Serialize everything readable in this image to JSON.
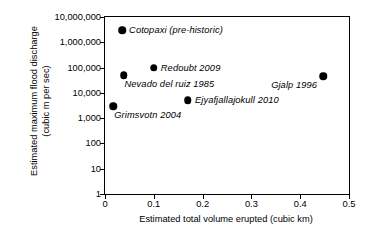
{
  "chart_data": {
    "type": "scatter",
    "title": "",
    "xlabel": "Estimated total volume erupted (cubic km)",
    "ylabel_line1": "Estimated maximum flood discharge",
    "ylabel_line2": "(cubic m per sec)",
    "xlim": [
      0,
      0.5
    ],
    "ylim": [
      1,
      10000000
    ],
    "yscale": "log",
    "xscale": "linear",
    "grid": false,
    "legend": "none",
    "xticks": [
      {
        "value": 0,
        "label": "0"
      },
      {
        "value": 0.1,
        "label": "0.1"
      },
      {
        "value": 0.2,
        "label": "0.2"
      },
      {
        "value": 0.3,
        "label": "0.3"
      },
      {
        "value": 0.4,
        "label": "0.4"
      },
      {
        "value": 0.5,
        "label": "0.5"
      }
    ],
    "yticks": [
      {
        "value": 10000000,
        "label": "10,000,000"
      },
      {
        "value": 1000000,
        "label": "1,000,000"
      },
      {
        "value": 100000,
        "label": "100,000"
      },
      {
        "value": 10000,
        "label": "10,000"
      },
      {
        "value": 1000,
        "label": "1,000"
      },
      {
        "value": 100,
        "label": "100"
      },
      {
        "value": 10,
        "label": "10"
      },
      {
        "value": 1,
        "label": "1"
      }
    ],
    "points": [
      {
        "label": "Cotopaxi (pre-historic)",
        "x": 0.035,
        "y": 3000000,
        "label_pos": "right"
      },
      {
        "label": "Redoubt 2009",
        "x": 0.1,
        "y": 100000,
        "label_pos": "right"
      },
      {
        "label": "Nevado del ruiz 1985",
        "x": 0.038,
        "y": 50000,
        "label_pos": "below-right"
      },
      {
        "label": "Gjalp 1996",
        "x": 0.447,
        "y": 45000,
        "label_pos": "below-left"
      },
      {
        "label": "Ejyafjallajokull 2010",
        "x": 0.17,
        "y": 5000,
        "label_pos": "right"
      },
      {
        "label": "Grimsvotn 2004",
        "x": 0.017,
        "y": 3000,
        "label_pos": "below-right"
      }
    ],
    "marker_color": "#000000",
    "axis_color": "#000000",
    "background_color": "#ffffff"
  }
}
